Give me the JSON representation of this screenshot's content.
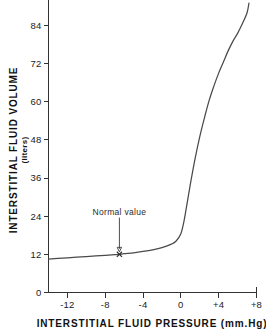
{
  "chart_data": {
    "type": "line",
    "title": "",
    "xlabel": "INTERSTITIAL FLUID PRESSURE  (mm.Hg)",
    "ylabel": "INTERSTITIAL  FLUID  VOLUME",
    "ylabel_units": "(liters)",
    "xlim": [
      -14,
      8
    ],
    "ylim": [
      0,
      92
    ],
    "grid": false,
    "legend": null,
    "xticks": [
      -12,
      -8,
      -4,
      0,
      4,
      8
    ],
    "xtick_labels": [
      "-12",
      "-8",
      "-4",
      "0",
      "+4",
      "+8"
    ],
    "yticks": [
      0,
      12,
      24,
      36,
      48,
      60,
      72,
      84
    ],
    "ytick_labels": [
      "0",
      "12",
      "24",
      "36",
      "48",
      "60",
      "72",
      "84"
    ],
    "series": [
      {
        "name": "Interstitial fluid volume compliance curve",
        "x": [
          -14,
          -13,
          -12,
          -11,
          -10,
          -9,
          -8,
          -7,
          -6.5,
          -6,
          -5,
          -4,
          -3,
          -2,
          -1,
          -0.5,
          0,
          0.3,
          0.6,
          1,
          1.5,
          2,
          2.5,
          3,
          3.5,
          4,
          4.5,
          5,
          5.5,
          6,
          6.5,
          7,
          7.2
        ],
        "y": [
          10.5,
          10.7,
          10.9,
          11.1,
          11.3,
          11.5,
          11.7,
          11.9,
          12.0,
          12.2,
          12.5,
          12.9,
          13.4,
          14.1,
          15.2,
          16.2,
          18.5,
          22,
          27,
          34,
          42,
          49,
          55,
          60.5,
          65,
          69,
          72.5,
          76,
          79,
          81.5,
          84.5,
          88,
          91
        ]
      }
    ],
    "annotations": [
      {
        "name": "normal-value",
        "label": "Normal  value",
        "marker": "x",
        "point_x": -6.5,
        "point_y": 12.0,
        "label_x": -6.5,
        "label_y": 24.5,
        "arrow": true
      }
    ],
    "colors": {
      "curve": "#4a4a4a",
      "axis": "#333333",
      "text": "#111111",
      "background": "#ffffff"
    }
  }
}
